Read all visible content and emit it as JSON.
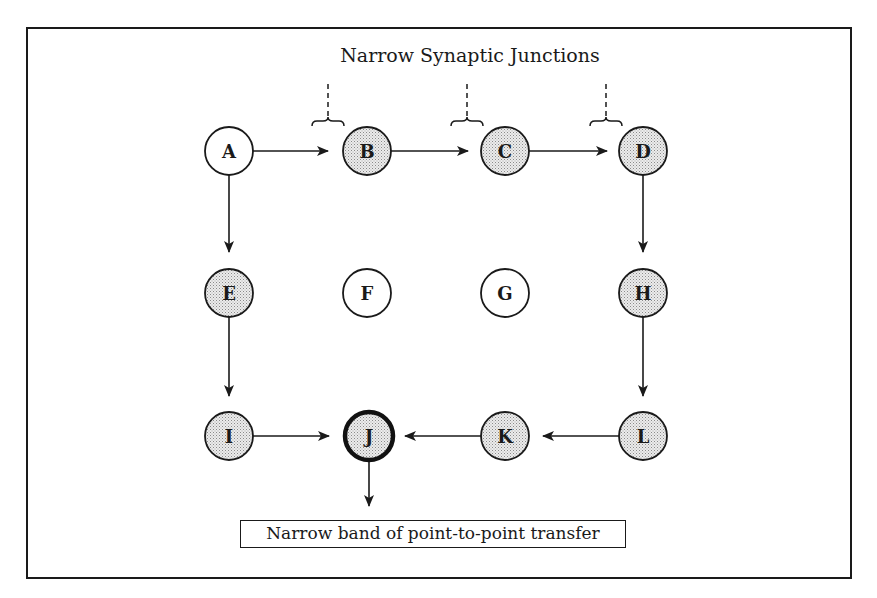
{
  "title": "Narrow Synaptic Junctions",
  "caption": "Narrow band of point-to-point transfer",
  "colors": {
    "stroke": "#1a1a1a",
    "shaded_fill": "#d9d9d9",
    "plain_fill": "#ffffff"
  },
  "nodes": [
    {
      "id": "A",
      "label": "A",
      "shaded": false,
      "emphasis": false
    },
    {
      "id": "B",
      "label": "B",
      "shaded": true,
      "emphasis": false
    },
    {
      "id": "C",
      "label": "C",
      "shaded": true,
      "emphasis": false
    },
    {
      "id": "D",
      "label": "D",
      "shaded": true,
      "emphasis": false
    },
    {
      "id": "E",
      "label": "E",
      "shaded": true,
      "emphasis": false
    },
    {
      "id": "F",
      "label": "F",
      "shaded": false,
      "emphasis": false
    },
    {
      "id": "G",
      "label": "G",
      "shaded": false,
      "emphasis": false
    },
    {
      "id": "H",
      "label": "H",
      "shaded": true,
      "emphasis": false
    },
    {
      "id": "I",
      "label": "I",
      "shaded": true,
      "emphasis": false
    },
    {
      "id": "J",
      "label": "J",
      "shaded": true,
      "emphasis": true
    },
    {
      "id": "K",
      "label": "K",
      "shaded": true,
      "emphasis": false
    },
    {
      "id": "L",
      "label": "L",
      "shaded": true,
      "emphasis": false
    }
  ],
  "edges": [
    {
      "from": "A",
      "to": "B"
    },
    {
      "from": "B",
      "to": "C"
    },
    {
      "from": "C",
      "to": "D"
    },
    {
      "from": "A",
      "to": "E"
    },
    {
      "from": "D",
      "to": "H"
    },
    {
      "from": "E",
      "to": "I"
    },
    {
      "from": "H",
      "to": "L"
    },
    {
      "from": "I",
      "to": "J"
    },
    {
      "from": "L",
      "to": "K"
    },
    {
      "from": "K",
      "to": "J"
    },
    {
      "from": "J",
      "to": "caption"
    }
  ],
  "junctions": [
    {
      "between": [
        "A",
        "B"
      ]
    },
    {
      "between": [
        "B",
        "C"
      ]
    },
    {
      "between": [
        "C",
        "D"
      ]
    }
  ]
}
